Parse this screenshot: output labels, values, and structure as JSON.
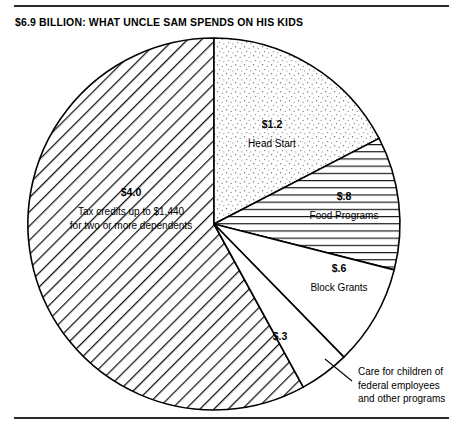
{
  "title": "$6.9 BILLION: WHAT UNCLE SAM SPENDS ON HIS KIDS",
  "callout": {
    "line1": "Care for children of",
    "line2": "federal employees",
    "line3": "and other programs"
  },
  "labels": {
    "head_start_amount": "$1.2",
    "head_start_name": "Head Start",
    "food_amount": "$.8",
    "food_name": "Food Programs",
    "block_amount": "$.6",
    "block_name": "Block Grants",
    "care_amount": "$.3",
    "tax_amount": "$4.0",
    "tax_name_line1": "Tax credits up to $1,440",
    "tax_name_line2": "for two or more dependents"
  },
  "colors": {
    "ink": "#000000",
    "rule": "#2b2b2b",
    "slice_fill": "#ffffff"
  },
  "chart_data": {
    "type": "pie",
    "title": "$6.9 BILLION: WHAT UNCLE SAM SPENDS ON HIS KIDS",
    "unit": "billions of dollars",
    "total": 6.9,
    "legend": "none",
    "grid": false,
    "start_angle_deg": 0,
    "direction": "clockwise",
    "categories": [
      "Head Start",
      "Food Programs",
      "Block Grants",
      "Care for children of federal employees and other programs",
      "Tax credits up to $1,440 for two or more dependents"
    ],
    "values": [
      1.2,
      0.8,
      0.6,
      0.3,
      4.0
    ],
    "value_labels": [
      "$1.2",
      "$.8",
      "$.6",
      "$.3",
      "$4.0"
    ],
    "percentages": [
      17.4,
      11.6,
      8.7,
      4.3,
      58.0
    ],
    "slice_patterns": [
      "stipple",
      "horizontal-hatch",
      "solid-white",
      "solid-white",
      "diagonal-hatch"
    ],
    "slices": [
      {
        "label": "Head Start",
        "value": 1.2,
        "value_label": "$1.2",
        "pattern": "stipple",
        "start_deg": 0.0,
        "end_deg": 62.6
      },
      {
        "label": "Food Programs",
        "value": 0.8,
        "value_label": "$.8",
        "pattern": "horizontal-hatch",
        "start_deg": 62.6,
        "end_deg": 104.3
      },
      {
        "label": "Block Grants",
        "value": 0.6,
        "value_label": "$.6",
        "pattern": "solid-white",
        "start_deg": 104.3,
        "end_deg": 135.7
      },
      {
        "label": "Care for children of federal employees and other programs",
        "value": 0.3,
        "value_label": "$.3",
        "pattern": "solid-white",
        "start_deg": 135.7,
        "end_deg": 151.3
      },
      {
        "label": "Tax credits up to $1,440 for two or more dependents",
        "value": 4.0,
        "value_label": "$4.0",
        "pattern": "diagonal-hatch",
        "start_deg": 151.3,
        "end_deg": 360.0
      }
    ]
  }
}
